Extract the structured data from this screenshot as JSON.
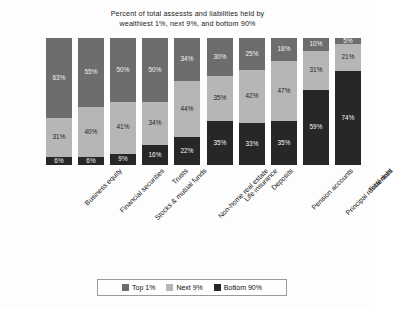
{
  "chart_data": {
    "type": "bar",
    "subtype": "stacked-bar-percent",
    "title": "Percent of total assessts and liabilities held by wealthiest 1%, next 9%, and bottom 90%",
    "title_lines": [
      "Percent of total assessts and liabilities held by",
      "wealthiest 1%, next 9%, and bottom 90%"
    ],
    "xlabel": "",
    "ylabel": "",
    "ylim": [
      0,
      100
    ],
    "grid": false,
    "legend_position": "bottom",
    "categories": [
      "Business equity",
      "Financial securities",
      "Stocks & mutual funds",
      "Trusts",
      "Non-home real estate",
      "Life insurance",
      "Deposits",
      "Pension accounts",
      "Principal residences",
      "Total debt"
    ],
    "series": [
      {
        "name": "Top 1%",
        "color": "#6d6d6d",
        "values": [
          63,
          55,
          50,
          50,
          34,
          30,
          25,
          18,
          10,
          5
        ],
        "labels": [
          "63%",
          "55%",
          "50%",
          "50%",
          "34%",
          "30%",
          "25%",
          "18%",
          "10%",
          "5%"
        ]
      },
      {
        "name": "Next 9%",
        "color": "#b6b6b6",
        "values": [
          31,
          40,
          41,
          34,
          44,
          35,
          42,
          47,
          31,
          21
        ],
        "labels": [
          "31%",
          "40%",
          "41%",
          "34%",
          "44%",
          "35%",
          "42%",
          "47%",
          "31%",
          "21%"
        ]
      },
      {
        "name": "Bottom 90%",
        "color": "#272727",
        "values": [
          6,
          6,
          9,
          16,
          22,
          35,
          33,
          35,
          59,
          74
        ],
        "labels": [
          "6%",
          "6%",
          "9%",
          "16%",
          "22%",
          "35%",
          "33%",
          "35%",
          "59%",
          "74%"
        ]
      }
    ]
  },
  "legend": {
    "items": [
      {
        "label": "Top 1%",
        "color": "#6d6d6d"
      },
      {
        "label": "Next 9%",
        "color": "#b6b6b6"
      },
      {
        "label": "Bottom 90%",
        "color": "#272727"
      }
    ]
  }
}
